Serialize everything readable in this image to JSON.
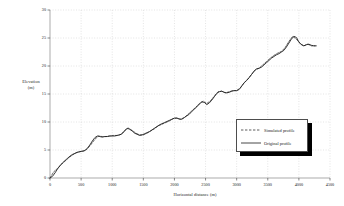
{
  "chart_data": {
    "type": "line",
    "title": "",
    "xlabel": "Horizontal distance (m)",
    "ylabel": "Elevation (m)",
    "ylabel_line1": "Elevation",
    "ylabel_line2": "(m)",
    "xlim": [
      0,
      4500
    ],
    "ylim": [
      0,
      30
    ],
    "xticks": [
      0,
      500,
      1000,
      1500,
      2000,
      2500,
      3000,
      3500,
      4000,
      4500
    ],
    "yticks": [
      0,
      5,
      10,
      15,
      20,
      25,
      30
    ],
    "grid": true,
    "grid_style": "dotted",
    "grid_color": "#c8c8c8",
    "legend_position": "right-lower",
    "series": [
      {
        "name": "Simulated profile",
        "style": "dashed",
        "color": "#333333",
        "x": [
          0,
          60,
          120,
          180,
          240,
          300,
          360,
          420,
          480,
          540,
          600,
          660,
          720,
          780,
          840,
          900,
          960,
          1020,
          1080,
          1140,
          1200,
          1260,
          1320,
          1380,
          1440,
          1500,
          1560,
          1620,
          1680,
          1740,
          1800,
          1860,
          1920,
          1980,
          2040,
          2100,
          2160,
          2220,
          2280,
          2340,
          2400,
          2460,
          2520,
          2580,
          2640,
          2700,
          2760,
          2820,
          2880,
          2940,
          3000,
          3060,
          3120,
          3180,
          3240,
          3300,
          3360,
          3420,
          3480,
          3540,
          3600,
          3660,
          3720,
          3780,
          3840,
          3900,
          3960,
          4020,
          4080,
          4140,
          4200,
          4260
        ],
        "y": [
          0.0,
          1.1,
          1.7,
          2.4,
          3.0,
          3.6,
          4.1,
          4.5,
          4.7,
          4.8,
          5.2,
          6.0,
          6.9,
          7.5,
          7.4,
          7.4,
          7.5,
          7.6,
          7.6,
          7.8,
          8.5,
          8.9,
          8.5,
          8.0,
          7.7,
          7.7,
          8.0,
          8.4,
          8.8,
          9.3,
          9.6,
          9.9,
          10.2,
          10.6,
          10.7,
          10.5,
          10.8,
          11.4,
          12.0,
          12.6,
          13.3,
          13.7,
          13.3,
          13.8,
          14.6,
          15.4,
          15.5,
          15.2,
          15.4,
          15.6,
          15.6,
          16.1,
          17.0,
          17.7,
          18.5,
          19.3,
          19.6,
          20.2,
          20.8,
          21.4,
          21.9,
          22.3,
          22.6,
          23.3,
          24.4,
          25.3,
          24.8,
          24.0,
          23.6,
          23.9,
          23.6,
          23.6
        ]
      },
      {
        "name": "Original profile",
        "style": "solid",
        "color": "#1a1a1a",
        "x": [
          0,
          40,
          80,
          120,
          160,
          200,
          240,
          280,
          320,
          360,
          400,
          440,
          480,
          520,
          560,
          600,
          640,
          680,
          720,
          760,
          800,
          840,
          880,
          920,
          960,
          1000,
          1040,
          1080,
          1120,
          1160,
          1200,
          1240,
          1280,
          1320,
          1360,
          1400,
          1440,
          1480,
          1520,
          1560,
          1600,
          1640,
          1680,
          1720,
          1760,
          1800,
          1840,
          1880,
          1920,
          1960,
          2000,
          2040,
          2080,
          2120,
          2160,
          2200,
          2240,
          2280,
          2320,
          2360,
          2400,
          2440,
          2480,
          2520,
          2560,
          2600,
          2640,
          2680,
          2720,
          2760,
          2800,
          2840,
          2880,
          2920,
          2960,
          3000,
          3040,
          3080,
          3120,
          3160,
          3200,
          3240,
          3280,
          3320,
          3360,
          3400,
          3440,
          3480,
          3520,
          3560,
          3600,
          3640,
          3680,
          3720,
          3760,
          3800,
          3840,
          3880,
          3920,
          3960,
          4000,
          4040,
          4080,
          4120,
          4160,
          4200,
          4240,
          4280
        ],
        "y": [
          0.0,
          0.3,
          0.9,
          1.6,
          2.2,
          2.7,
          3.1,
          3.5,
          3.9,
          4.2,
          4.4,
          4.6,
          4.7,
          4.8,
          4.9,
          5.3,
          5.9,
          6.6,
          7.2,
          7.5,
          7.4,
          7.3,
          7.4,
          7.4,
          7.5,
          7.5,
          7.5,
          7.6,
          7.7,
          7.9,
          8.4,
          8.9,
          8.7,
          8.4,
          8.0,
          7.8,
          7.6,
          7.7,
          7.9,
          8.1,
          8.3,
          8.6,
          8.9,
          9.2,
          9.5,
          9.7,
          9.9,
          10.1,
          10.3,
          10.5,
          10.7,
          10.7,
          10.5,
          10.5,
          10.8,
          11.1,
          11.4,
          11.9,
          12.3,
          12.7,
          13.2,
          13.6,
          13.5,
          13.1,
          13.4,
          13.9,
          14.5,
          15.1,
          15.4,
          15.5,
          15.3,
          15.2,
          15.3,
          15.5,
          15.6,
          15.6,
          15.8,
          16.4,
          17.0,
          17.4,
          17.9,
          18.5,
          19.1,
          19.5,
          19.6,
          19.8,
          20.2,
          20.6,
          21.0,
          21.4,
          21.7,
          22.0,
          22.2,
          22.5,
          22.8,
          23.4,
          24.1,
          24.8,
          25.3,
          25.1,
          24.3,
          23.8,
          23.6,
          23.8,
          23.9,
          23.7,
          23.6,
          23.6
        ]
      }
    ]
  }
}
